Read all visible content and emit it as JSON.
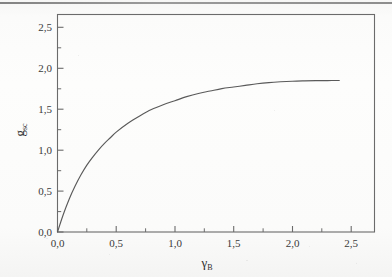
{
  "figure": {
    "kind": "scanned-plot",
    "background_color": "#fdfdfc",
    "axis_color": "#6b6b6b",
    "curve_color": "#5a5a5a",
    "top_artifact_color": "#7a7a7a"
  },
  "chart_data": {
    "type": "line",
    "title": "",
    "subtitle": "",
    "xlabel": "γ",
    "xlabel_sub": "B",
    "xlabel_full": "γ_B",
    "ylabel": "g",
    "ylabel_sub": "sc",
    "ylabel_full": "g_sc",
    "xlim": [
      0.0,
      2.7
    ],
    "ylim": [
      0.0,
      2.7
    ],
    "xticks": [
      0.0,
      0.5,
      1.0,
      1.5,
      2.0,
      2.5
    ],
    "yticks": [
      0.0,
      0.5,
      1.0,
      1.5,
      2.0,
      2.5
    ],
    "xticklabels": [
      "0,0",
      "0,5",
      "1,0",
      "1,5",
      "2,0",
      "2,5"
    ],
    "yticklabels": [
      "0,0",
      "0,5",
      "1,0",
      "1,5",
      "2,0",
      "2,5"
    ],
    "minor_ticks_per_interval": 1,
    "decimal_separator": ",",
    "grid": false,
    "legend": null,
    "legend_position": "none",
    "tick_direction": "in",
    "series": [
      {
        "name": "g_sc",
        "x": [
          0.0,
          0.05,
          0.1,
          0.15,
          0.2,
          0.25,
          0.3,
          0.35,
          0.4,
          0.45,
          0.5,
          0.6,
          0.7,
          0.8,
          0.9,
          1.0,
          1.1,
          1.2,
          1.3,
          1.4,
          1.5,
          1.6,
          1.7,
          1.8,
          1.9,
          2.0,
          2.1,
          2.2,
          2.3,
          2.4
        ],
        "values": [
          0.0,
          0.22,
          0.41,
          0.57,
          0.71,
          0.83,
          0.93,
          1.02,
          1.1,
          1.17,
          1.24,
          1.35,
          1.44,
          1.52,
          1.58,
          1.63,
          1.68,
          1.72,
          1.75,
          1.78,
          1.8,
          1.82,
          1.84,
          1.855,
          1.865,
          1.872,
          1.876,
          1.879,
          1.88,
          1.881
        ],
        "x_end": 2.4,
        "y_asymptote": 1.88,
        "shape": "monotonic saturating"
      }
    ]
  }
}
